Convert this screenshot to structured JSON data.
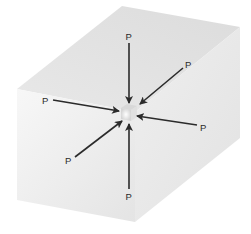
{
  "diagram": {
    "labels": {
      "top": "P",
      "upper_right": "P",
      "left": "P",
      "right": "P",
      "lower_left": "P",
      "bottom": "P"
    },
    "colors": {
      "arrow": "#2b2b2b",
      "front_face": "#eeeeee",
      "top_face": "#e2e2e2",
      "right_face": "#e6e6e6",
      "background": "#ffffff"
    }
  }
}
